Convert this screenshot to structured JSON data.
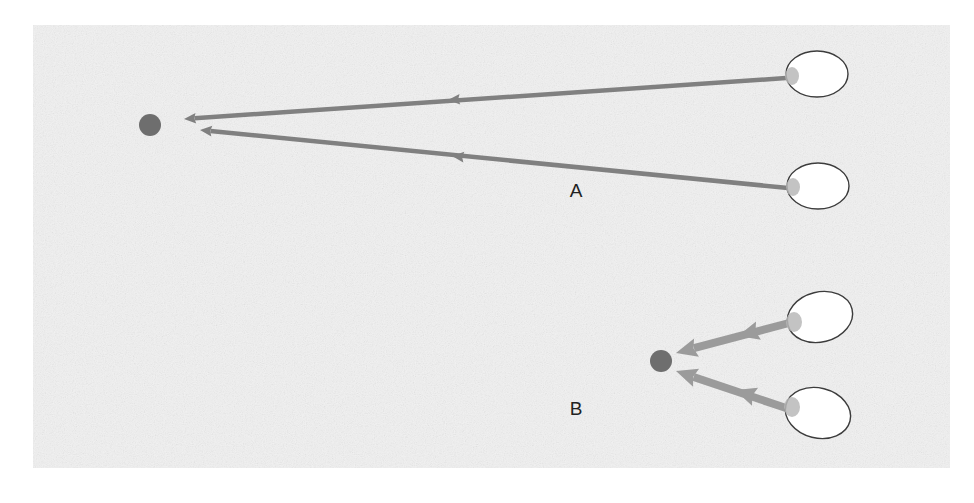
{
  "figure": {
    "page_background": "#ffffff",
    "panel": {
      "name": "textured-panel",
      "x": 33,
      "y": 25,
      "width": 917,
      "height": 443,
      "fill": "#f2f2f2",
      "texture": "speckled-noise"
    },
    "panels": [
      {
        "id": "A",
        "label": "A",
        "label_x": 576,
        "label_y": 192,
        "arrow_color": "#808080",
        "arrow_width": 4.5,
        "target": {
          "name": "target-node-a",
          "cx": 150,
          "cy": 125,
          "r": 11,
          "fill": "#6e6e6e"
        },
        "sources": [
          {
            "name": "source-ellipse-a1",
            "cx": 817,
            "cy": 74,
            "rx": 31,
            "ry": 23,
            "rotation": 0,
            "fill": "#ffffff",
            "stroke": "#3c3c3c",
            "marker": {
              "cx": 792,
              "cy": 76,
              "rx": 7,
              "ry": 9,
              "fill": "#b8b8b8"
            }
          },
          {
            "name": "source-ellipse-a2",
            "cx": 818,
            "cy": 186,
            "rx": 31,
            "ry": 23,
            "rotation": 0,
            "fill": "#ffffff",
            "stroke": "#3c3c3c",
            "marker": {
              "cx": 793,
              "cy": 187,
              "rx": 7,
              "ry": 9,
              "fill": "#b8b8b8"
            }
          }
        ],
        "arrows": [
          {
            "name": "arrow-a1",
            "from_x": 786,
            "from_y": 78,
            "to_x": 184,
            "to_y": 119,
            "mid_head_x": 448,
            "mid_head_y": 100
          },
          {
            "name": "arrow-a2",
            "from_x": 788,
            "from_y": 188,
            "to_x": 200,
            "to_y": 130,
            "mid_head_x": 452,
            "mid_head_y": 156
          }
        ]
      },
      {
        "id": "B",
        "label": "B",
        "label_x": 576,
        "label_y": 410,
        "arrow_color": "#9b9b9b",
        "arrow_width": 8,
        "target": {
          "name": "target-node-b",
          "cx": 661,
          "cy": 361,
          "r": 11,
          "fill": "#6e6e6e"
        },
        "sources": [
          {
            "name": "source-ellipse-b1",
            "cx": 820,
            "cy": 317,
            "rx": 33,
            "ry": 25,
            "rotation": -14,
            "fill": "#ffffff",
            "stroke": "#3c3c3c",
            "marker": {
              "cx": 794,
              "cy": 322,
              "rx": 8,
              "ry": 10,
              "fill": "#b8b8b8"
            }
          },
          {
            "name": "source-ellipse-b2",
            "cx": 818,
            "cy": 413,
            "rx": 33,
            "ry": 25,
            "rotation": 14,
            "fill": "#ffffff",
            "stroke": "#3c3c3c",
            "marker": {
              "cx": 792,
              "cy": 407,
              "rx": 8,
              "ry": 10,
              "fill": "#b8b8b8"
            }
          }
        ],
        "arrows": [
          {
            "name": "arrow-b1",
            "from_x": 789,
            "from_y": 323,
            "to_x": 676,
            "to_y": 353,
            "mid_head_x": 738,
            "mid_head_y": 336
          },
          {
            "name": "arrow-b2",
            "from_x": 786,
            "from_y": 408,
            "to_x": 676,
            "to_y": 371,
            "mid_head_x": 735,
            "mid_head_y": 390
          }
        ]
      }
    ]
  }
}
